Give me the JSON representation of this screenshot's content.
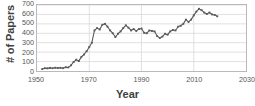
{
  "chart_data": {
    "type": "line",
    "title": "",
    "xlabel": "Year",
    "ylabel": "# of Papers",
    "xlim": [
      1950,
      2030
    ],
    "ylim": [
      0,
      700
    ],
    "xticks": [
      1950,
      1970,
      1990,
      2010,
      2030
    ],
    "yticks": [
      0,
      100,
      200,
      300,
      400,
      500,
      600,
      700
    ],
    "grid": true,
    "legend": null,
    "marker": "square",
    "series_color": "#5a5a5a",
    "grid_color": "#d9d9d9",
    "axis_color": "#b9b9b9",
    "series": [
      {
        "name": "# of Papers",
        "x": [
          1952,
          1953,
          1954,
          1955,
          1956,
          1957,
          1958,
          1959,
          1960,
          1961,
          1962,
          1963,
          1964,
          1965,
          1966,
          1967,
          1968,
          1969,
          1970,
          1971,
          1972,
          1973,
          1974,
          1975,
          1976,
          1977,
          1978,
          1979,
          1980,
          1981,
          1982,
          1983,
          1984,
          1985,
          1986,
          1987,
          1988,
          1989,
          1990,
          1991,
          1992,
          1993,
          1994,
          1995,
          1996,
          1997,
          1998,
          1999,
          2000,
          2001,
          2002,
          2003,
          2004,
          2005,
          2006,
          2007,
          2008,
          2009,
          2010,
          2011,
          2012,
          2013,
          2014,
          2015,
          2016,
          2017,
          2018,
          2019
        ],
        "values": [
          20,
          30,
          28,
          33,
          30,
          35,
          32,
          34,
          30,
          40,
          38,
          60,
          95,
          120,
          105,
          150,
          175,
          210,
          255,
          300,
          430,
          455,
          440,
          490,
          500,
          470,
          430,
          400,
          360,
          395,
          420,
          455,
          485,
          460,
          430,
          445,
          425,
          445,
          450,
          405,
          400,
          430,
          425,
          420,
          370,
          350,
          365,
          395,
          385,
          420,
          435,
          430,
          470,
          480,
          500,
          545,
          520,
          545,
          590,
          630,
          660,
          645,
          620,
          605,
          620,
          600,
          595,
          580
        ]
      }
    ]
  }
}
